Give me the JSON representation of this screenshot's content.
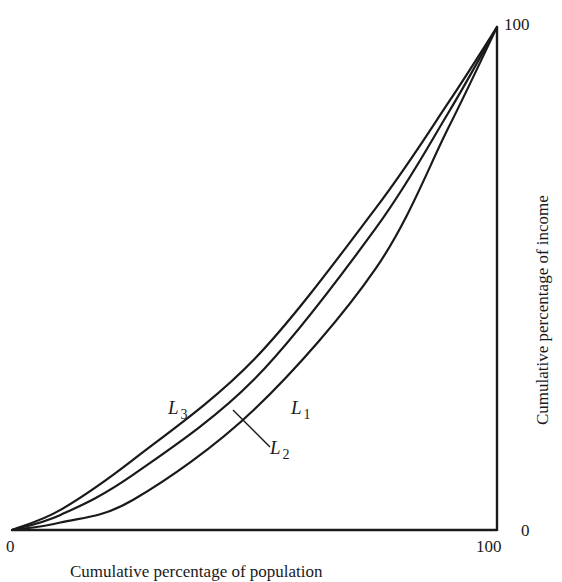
{
  "chart_data": {
    "type": "line",
    "title": "",
    "subtitle": "Lorenz curves",
    "xlabel": "Cumulative percentage of population",
    "ylabel": "Cumulative percentage of income",
    "xlim": [
      0,
      100
    ],
    "ylim": [
      0,
      100
    ],
    "grid": false,
    "legend": "inline labels on curves",
    "x_ticks": [
      "0",
      "100"
    ],
    "y_ticks": [
      "0",
      "100"
    ],
    "x": [
      0,
      10,
      25,
      50,
      75,
      90,
      100
    ],
    "series": [
      {
        "name": "L3",
        "values": [
          0,
          4,
          14,
          34,
          64,
          85,
          100
        ]
      },
      {
        "name": "L2",
        "values": [
          0,
          3,
          11,
          30,
          60,
          83,
          100
        ]
      },
      {
        "name": "L1",
        "values": [
          0,
          1.5,
          6,
          24,
          52,
          80,
          100
        ]
      }
    ],
    "annotations": [
      {
        "text": "L3",
        "target": "outer-left curve (closest to equality)"
      },
      {
        "text": "L1",
        "target": "outer-right curve (most unequal)"
      },
      {
        "text": "L2",
        "target": "middle curve, via leader line"
      }
    ]
  },
  "labels": {
    "x_tick_0": "0",
    "x_tick_100": "100",
    "y_tick_0": "0",
    "y_tick_100": "100",
    "y_axis_title": "Cumulative percentage of income",
    "x_axis_title": "Cumulative percentage of population",
    "L3": {
      "main": "L",
      "sub": "3"
    },
    "L1": {
      "main": "L",
      "sub": "1"
    },
    "L2": {
      "main": "L",
      "sub": "2"
    }
  },
  "colors": {
    "ink": "#1a1a1a",
    "background": "#ffffff"
  }
}
